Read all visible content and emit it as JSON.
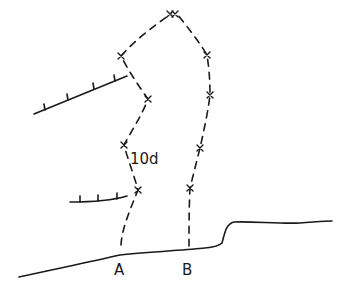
{
  "diagram": {
    "type": "climbing-route-topo",
    "ink_color": "#1a1a1a",
    "background": "#ffffff",
    "grade_label": "10d",
    "routes": [
      {
        "name": "A",
        "start_label": "A",
        "bolts": [
          [
            138,
            190
          ],
          [
            124,
            145
          ],
          [
            148,
            99
          ],
          [
            121,
            56
          ]
        ]
      },
      {
        "name": "B",
        "start_label": "B",
        "bolts": [
          [
            190,
            188
          ],
          [
            200,
            148
          ],
          [
            210,
            95
          ],
          [
            207,
            55
          ]
        ]
      }
    ],
    "anchor": {
      "label": "xx",
      "position": [
        173,
        15
      ]
    },
    "ledges": [
      {
        "name": "upper-roof",
        "ticks": 4
      },
      {
        "name": "lower-roof",
        "ticks": 3
      }
    ],
    "ground": {
      "name": "ground-line"
    }
  }
}
